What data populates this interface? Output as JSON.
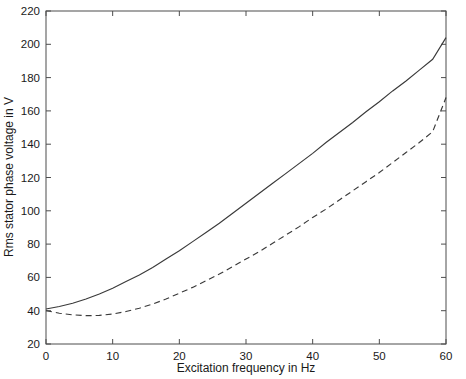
{
  "chart_data": {
    "type": "line",
    "title": "",
    "xlabel": "Excitation frequency in Hz",
    "ylabel": "Rms stator phase voltage in V",
    "xlim": [
      0,
      60
    ],
    "ylim": [
      20,
      220
    ],
    "xticks": [
      0,
      10,
      20,
      30,
      40,
      50,
      60
    ],
    "yticks": [
      20,
      40,
      60,
      80,
      100,
      120,
      140,
      160,
      180,
      200,
      220
    ],
    "xtick_labels": [
      "0",
      "10",
      "20",
      "30",
      "40",
      "50",
      "60"
    ],
    "ytick_labels": [
      "20",
      "40",
      "60",
      "80",
      "100",
      "120",
      "140",
      "160",
      "180",
      "200",
      "220"
    ],
    "grid": false,
    "legend": null,
    "x": [
      0,
      2,
      4,
      6,
      8,
      10,
      12,
      14,
      16,
      18,
      20,
      22,
      24,
      26,
      28,
      30,
      32,
      34,
      36,
      38,
      40,
      42,
      44,
      46,
      48,
      50,
      52,
      54,
      56,
      58,
      60
    ],
    "series": [
      {
        "name": "solid-curve",
        "style": "solid",
        "color": "#3a3a3a",
        "values": [
          41.0,
          42.5,
          44.5,
          47.0,
          50.0,
          53.5,
          57.5,
          61.5,
          66.0,
          71.0,
          76.0,
          81.5,
          87.0,
          92.5,
          98.5,
          104.5,
          110.5,
          116.5,
          122.5,
          128.5,
          134.5,
          141.0,
          147.0,
          153.0,
          159.5,
          165.5,
          172.0,
          178.0,
          184.5,
          191.0,
          204.0
        ]
      },
      {
        "name": "dashed-curve",
        "style": "dashed",
        "color": "#3a3a3a",
        "values": [
          40.0,
          38.5,
          37.5,
          37.0,
          37.2,
          38.0,
          39.5,
          41.5,
          44.0,
          47.0,
          50.5,
          54.0,
          58.0,
          62.0,
          66.5,
          71.0,
          75.5,
          80.5,
          85.5,
          90.5,
          96.0,
          101.0,
          106.5,
          112.0,
          117.5,
          123.0,
          129.0,
          135.0,
          141.0,
          147.5,
          168.0
        ]
      }
    ]
  }
}
